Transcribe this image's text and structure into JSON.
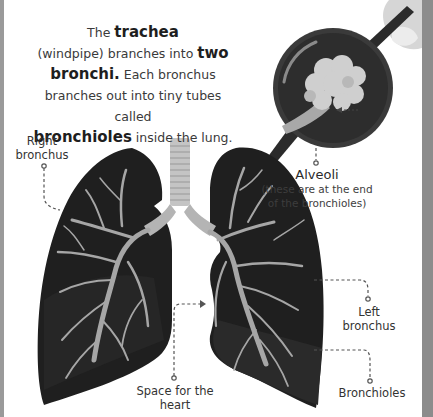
{
  "intro": {
    "line1_pre": "The ",
    "term_trachea": "trachea",
    "line2": "(windpipe) branches into ",
    "term_two": "two",
    "term_bronchi": "bronchi.",
    "line3": " Each bronchus",
    "line4": "branches out into tiny tubes called",
    "term_bronchioles": "bronchioles",
    "line5": " inside the lung."
  },
  "labels": {
    "right_bronchus": {
      "line1": "Right",
      "line2": "bronchus"
    },
    "alveoli": {
      "title": "Alveoli",
      "note1": "(these are at the end",
      "note2": "of the bronchioles)"
    },
    "left_bronchus": {
      "line1": "Left",
      "line2": "bronchus"
    },
    "heart_space": {
      "line1": "Space for the",
      "line2": "heart"
    },
    "bronchioles": {
      "line1": "Bronchioles"
    }
  },
  "colors": {
    "lung": "#1f1f1f",
    "lung_shade": "#2c2c2c",
    "airway": "#a6a6a6",
    "trachea": "#c4c4c4",
    "magnifier_rim": "#3a3a3a",
    "magnifier_fill": "#2d2d2d",
    "alveoli": "#cfcfcf",
    "frame": "#8c8c8c",
    "callout_line": "#555555"
  }
}
